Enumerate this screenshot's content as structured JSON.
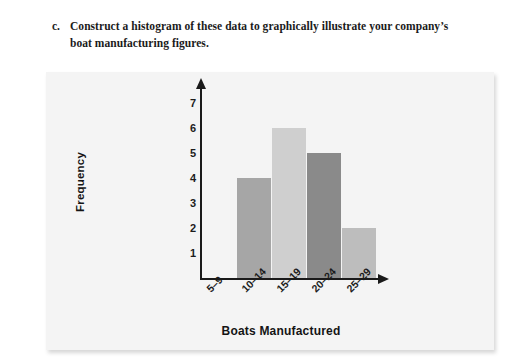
{
  "prompt": {
    "letter": "c.",
    "text": "Construct a histogram of these data to graphically illustrate your company’s boat manufacturing figures."
  },
  "chart_data": {
    "type": "bar",
    "title": "",
    "xlabel": "Boats Manufactured",
    "ylabel": "Frequency",
    "categories": [
      "5–9",
      "10–14",
      "15–19",
      "20–24",
      "25–29"
    ],
    "values": [
      0,
      4,
      6,
      5,
      2
    ],
    "bar_colors": [
      "#f4f4f4",
      "#a6a6a6",
      "#cfcfcf",
      "#8a8a8a",
      "#bdbdbd"
    ],
    "ylim": [
      0,
      7.6
    ],
    "y_ticks": [
      "7",
      "6",
      "5",
      "4",
      "3",
      "2",
      "1"
    ],
    "y_tick_values": [
      7,
      6,
      5,
      4,
      3,
      2,
      1
    ],
    "grid": false,
    "legend": "none",
    "axis_color": "#1a1a1a",
    "plot_background": "#f4f4f4"
  }
}
